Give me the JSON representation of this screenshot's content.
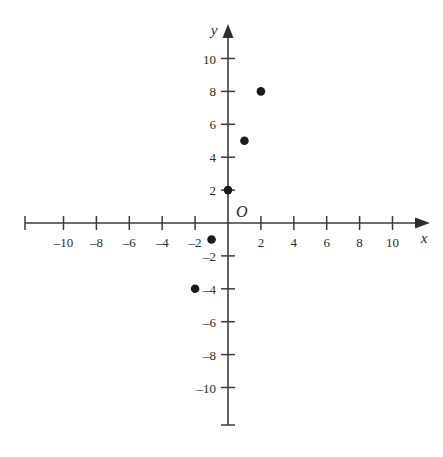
{
  "chart_data": {
    "type": "scatter",
    "title": "",
    "xlabel": "x",
    "ylabel": "y",
    "xlim": [
      -11.5,
      11.5
    ],
    "ylim": [
      -11.5,
      11.5
    ],
    "grid": false,
    "legend": null,
    "origin_label": "O",
    "x_ticks": [
      -10,
      -8,
      -6,
      -4,
      -2,
      2,
      4,
      6,
      8,
      10
    ],
    "y_ticks": [
      10,
      8,
      6,
      4,
      2,
      -2,
      -4,
      -6,
      -8,
      -10
    ],
    "x_tick_labels": [
      "–10",
      "–8",
      "–6",
      "–4",
      "–2",
      "2",
      "4",
      "6",
      "8",
      "10"
    ],
    "y_tick_labels": [
      "10",
      "8",
      "6",
      "4",
      "2",
      "–2",
      "–4",
      "–6",
      "–8",
      "–10"
    ],
    "points": [
      {
        "x": 0,
        "y": 2,
        "label": "(0, 2)"
      },
      {
        "x": 1,
        "y": 5,
        "label": "(1, 5)"
      },
      {
        "x": 2,
        "y": 8,
        "label": "(2, 8)"
      },
      {
        "x": -1,
        "y": -1,
        "label": "(-1, -1)"
      },
      {
        "x": -2,
        "y": -4,
        "label": "(-2, -4)"
      }
    ],
    "point_color": "#1b1b1b",
    "axis_color": "#3b3b3b",
    "background_color": "#ffffff"
  }
}
